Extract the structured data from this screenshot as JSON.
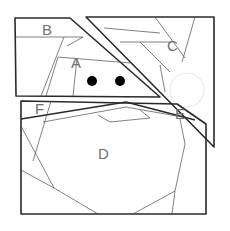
{
  "diagram": {
    "type": "geometric-piece-layout",
    "regions": [
      {
        "id": "A",
        "label": "A",
        "x": 76,
        "y": 66
      },
      {
        "id": "B",
        "label": "B",
        "x": 48,
        "y": 33
      },
      {
        "id": "C",
        "label": "C",
        "x": 172,
        "y": 49
      },
      {
        "id": "D",
        "label": "D",
        "x": 103,
        "y": 156
      },
      {
        "id": "E",
        "label": "E",
        "x": 180,
        "y": 117
      },
      {
        "id": "F",
        "label": "F",
        "x": 40,
        "y": 111
      }
    ],
    "dots": [
      {
        "name": "left-eye-dot",
        "cx": 92,
        "cy": 81,
        "r": 5
      },
      {
        "name": "right-eye-dot",
        "cx": 120,
        "cy": 81,
        "r": 5
      }
    ],
    "colors": {
      "outline": "#2a2a2a",
      "inner_line": "#4a4a4a",
      "label": "#707070",
      "dot": "#000000",
      "background": "#ffffff"
    }
  }
}
